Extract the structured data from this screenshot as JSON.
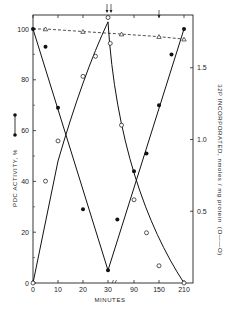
{
  "chart_data": {
    "type": "line",
    "title": "",
    "xlabel": "MINUTES",
    "ylabel_left": "PDC ACTIVITY, %",
    "ylabel_right": "32P INCORPORATED, nmoles / mg protein",
    "ylabel_right_legend": "(O——O)",
    "x_tick_labels": [
      "0",
      "10",
      "20",
      "30",
      "90",
      "150",
      "210"
    ],
    "x_tick_positions": [
      0,
      10,
      20,
      30,
      90,
      150,
      210
    ],
    "x_axis_note": "axis break after 30 min; 30–210 min compressed",
    "y_left_ticks": [
      "0",
      "20",
      "40",
      "60",
      "80",
      "100"
    ],
    "y_left_range": [
      0,
      105
    ],
    "y_right_ticks": [
      "0.5",
      "1.0",
      "1.5"
    ],
    "y_right_range": [
      0,
      1.85
    ],
    "grid": false,
    "annotations": [
      "arrows at ~30 min (top)",
      "arrow at ~150 min (top)"
    ],
    "series": [
      {
        "name": "PDC activity (filled circles, solid line)",
        "axis": "left",
        "marker": "filled-circle",
        "line": "solid",
        "x": [
          0,
          5,
          10,
          20,
          30,
          50,
          90,
          120,
          150,
          180,
          210
        ],
        "values": [
          100,
          93,
          69,
          29,
          5,
          25,
          44,
          51,
          70,
          90,
          100
        ]
      },
      {
        "name": "32P incorporated (open circles, solid line)",
        "axis": "right",
        "marker": "open-circle",
        "line": "solid",
        "x": [
          0,
          5,
          10,
          20,
          25,
          30,
          33,
          60,
          90,
          120,
          150,
          210
        ],
        "values": [
          0,
          0.71,
          0.99,
          1.44,
          1.58,
          1.85,
          1.67,
          1.1,
          0.58,
          0.35,
          0.12,
          0
        ]
      },
      {
        "name": "Control PDC activity (open triangles, dashed line)",
        "axis": "left",
        "marker": "open-triangle",
        "line": "dashed",
        "x": [
          0,
          5,
          20,
          60,
          150,
          210
        ],
        "values": [
          100,
          100,
          99,
          98,
          97,
          96
        ]
      }
    ]
  }
}
